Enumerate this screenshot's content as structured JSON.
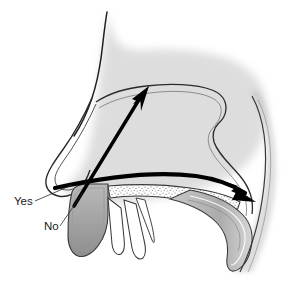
{
  "figure": {
    "background_color": "#ffffff",
    "line_color": "#1a1a1a",
    "arrow_color": "#000000",
    "shadow_color": "#b3b3b3",
    "tissue_fill": "#9e9e9e",
    "bone_stipple_color": "#7a7a7a"
  },
  "labels": {
    "yes": {
      "text": "Yes",
      "x": 14,
      "y": 205,
      "meaning": "correct spray direction: backward toward nasopharynx"
    },
    "no": {
      "text": "No",
      "x": 44,
      "y": 230,
      "meaning": "incorrect spray direction: upward toward nasal bridge"
    }
  },
  "arrows": [
    {
      "name": "correct-direction-arrow",
      "label_ref": "yes",
      "style": "thick curved horizontal arrow",
      "from": [
        60,
        192
      ],
      "to": [
        252,
        196
      ],
      "direction": "posterior / backward"
    },
    {
      "name": "incorrect-direction-arrow",
      "label_ref": "no",
      "style": "thick straight diagonal arrow",
      "from": [
        75,
        205
      ],
      "to": [
        148,
        90
      ],
      "direction": "superior / upward"
    }
  ],
  "anatomy": [
    "nasal bridge profile",
    "nose tip",
    "nostril",
    "nasal cavity",
    "turbinate",
    "hard palate",
    "soft palate",
    "nasopharynx",
    "posterior pharyngeal wall"
  ]
}
